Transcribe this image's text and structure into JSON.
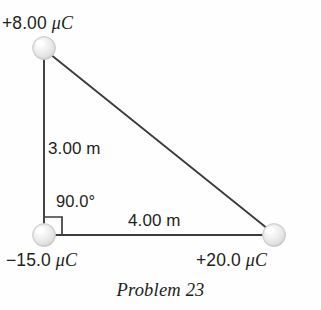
{
  "figure": {
    "caption": "Problem 23",
    "background_color": "#fefefe",
    "ink_color": "#231f20",
    "line_color": "#3c3c3c",
    "sphere_fill": "#e8e8e8",
    "charges": [
      {
        "id": "charge-top",
        "label": "+8.00 ",
        "unit": "μC",
        "position_label": "top",
        "x": 44,
        "y": 48
      },
      {
        "id": "charge-bottom-left",
        "label": "−15.0 ",
        "unit": "μC",
        "position_label": "bottom-left",
        "x": 44,
        "y": 235
      },
      {
        "id": "charge-bottom-right",
        "label": "+20.0 ",
        "unit": "μC",
        "position_label": "bottom-right",
        "x": 274,
        "y": 235
      }
    ],
    "dimensions": {
      "vertical_side": "3.00 m",
      "horizontal_side": "4.00 m",
      "angle": "90.0°"
    },
    "icons": {
      "right_angle_marker": "right-angle-icon",
      "sphere": "sphere-icon"
    }
  }
}
